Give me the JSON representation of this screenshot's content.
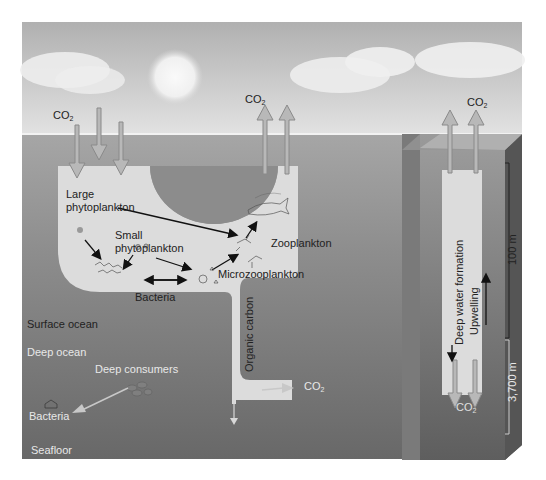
{
  "diagram": {
    "colors": {
      "background": "#ffffff",
      "sky_top": "#b4b4b4",
      "sky_bottom": "#dedede",
      "sun": "#f2f2f2",
      "cloud": "#ececec",
      "ocean_surface": "#a0a0a0",
      "ocean_mid": "#8a8a8a",
      "ocean_deep": "#6e6e6e",
      "seafloor": "#626262",
      "column_fill": "#dcdcdc",
      "arrow_fill": "#b8b8b8",
      "arrow_stroke": "#8a8a8a",
      "text_dark": "#222222",
      "text_light": "#e8e8e8"
    },
    "labels": {
      "co2_left": "CO",
      "co2_mid": "CO",
      "co2_right_top": "CO",
      "co2_right_bottom": "CO",
      "co2_outflow": "CO",
      "subscript": "2",
      "large_phyto_1": "Large",
      "large_phyto_2": "phytoplankton",
      "small_phyto_1": "Small",
      "small_phyto_2": "phytoplankton",
      "zooplankton": "Zooplankton",
      "microzooplankton": "Microzooplankton",
      "bacteria_surface": "Bacteria",
      "organic_carbon": "Organic carbon",
      "surface_ocean": "Surface ocean",
      "deep_ocean": "Deep ocean",
      "deep_consumers": "Deep consumers",
      "bacteria_deep": "Bacteria",
      "seafloor": "Seafloor",
      "deep_water_formation": "Deep water formation",
      "upwelling": "Upwelling",
      "scale_100m": "100 m",
      "scale_3700m": "3,700 m"
    }
  }
}
